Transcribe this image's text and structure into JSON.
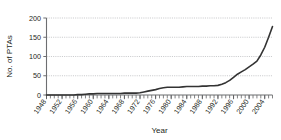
{
  "chart_data": {
    "type": "line",
    "title": "",
    "xlabel": "Year",
    "ylabel": "No. of PTAs",
    "xlim": [
      1948,
      2006
    ],
    "ylim": [
      0,
      200
    ],
    "grid": true,
    "legend": null,
    "y_ticks": [
      0,
      50,
      100,
      150,
      200
    ],
    "y_tick_labels": [
      "0",
      "50",
      "100",
      "150",
      "200"
    ],
    "x_ticks": [
      1948,
      1952,
      1956,
      1960,
      1964,
      1968,
      1972,
      1976,
      1980,
      1984,
      1988,
      1992,
      1996,
      2000,
      2004
    ],
    "x_tick_labels": [
      "1948",
      "1952",
      "1956",
      "1960",
      "1964",
      "1968",
      "1972",
      "1976",
      "1980",
      "1984",
      "1988",
      "1992",
      "1996",
      "2000",
      "2004"
    ],
    "x_minor_tick_interval": 1,
    "series": [
      {
        "name": "No. of PTAs",
        "color": "#333333",
        "x": [
          1948,
          1949,
          1950,
          1951,
          1952,
          1953,
          1954,
          1955,
          1956,
          1957,
          1958,
          1959,
          1960,
          1961,
          1962,
          1963,
          1964,
          1965,
          1966,
          1967,
          1968,
          1969,
          1970,
          1971,
          1972,
          1973,
          1974,
          1975,
          1976,
          1977,
          1978,
          1979,
          1980,
          1981,
          1982,
          1983,
          1984,
          1985,
          1986,
          1987,
          1988,
          1989,
          1990,
          1991,
          1992,
          1993,
          1994,
          1995,
          1996,
          1997,
          1998,
          1999,
          2000,
          2001,
          2002,
          2003,
          2004,
          2005,
          2006
        ],
        "values": [
          0,
          0,
          0,
          0,
          0,
          0,
          0,
          0,
          1,
          1,
          2,
          3,
          3,
          4,
          4,
          4,
          4,
          4,
          4,
          4,
          5,
          5,
          5,
          5,
          6,
          8,
          10,
          12,
          14,
          17,
          19,
          20,
          20,
          20,
          20,
          21,
          22,
          22,
          22,
          22,
          23,
          23,
          24,
          24,
          25,
          28,
          32,
          38,
          46,
          54,
          60,
          66,
          73,
          80,
          88,
          104,
          124,
          150,
          178
        ]
      }
    ],
    "annotations": []
  },
  "colors": {
    "line": "#333333",
    "grid": "#a7a9ac",
    "axis": "#6d6e71",
    "text": "#231f20",
    "background": "#ffffff"
  }
}
